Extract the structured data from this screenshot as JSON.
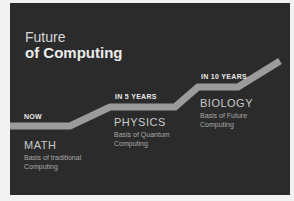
{
  "title": {
    "line1": "Future",
    "line2": "of Computing"
  },
  "colors": {
    "panel_bg": "#2b2b2b",
    "path": "#9b9b9b",
    "text": "#e6e6e6"
  },
  "stages": [
    {
      "label": "NOW",
      "name": "MATH",
      "desc_line1": "Basis of traditional",
      "desc_line2": "Computing"
    },
    {
      "label": "IN 5 YEARS",
      "name": "PHYSICS",
      "desc_line1": "Basis of Quantum",
      "desc_line2": "Computing"
    },
    {
      "label": "IN 10 YEARS",
      "name": "BIOLOGY",
      "desc_line1": "Basis of Future",
      "desc_line2": "Computing"
    }
  ]
}
